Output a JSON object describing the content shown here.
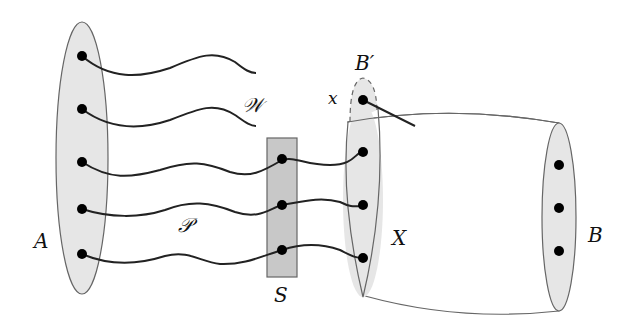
{
  "diagram": {
    "labels": {
      "A": "A",
      "W": "𝒲",
      "P": "𝒫",
      "S": "S",
      "X": "X",
      "B": "B",
      "B_prime": "B′",
      "x": "x"
    },
    "colors": {
      "ellipse_fill": "#e6e6e6",
      "separator_fill": "#c8c8c8",
      "stroke": "#555555",
      "path": "#222222",
      "vertex": "#000000"
    },
    "sets": [
      {
        "name": "A",
        "vertices": 5
      },
      {
        "name": "S",
        "vertices": 3
      },
      {
        "name": "X",
        "vertices": 3
      },
      {
        "name": "B'",
        "vertices": 1
      },
      {
        "name": "B",
        "vertices": 3
      }
    ],
    "path_families": [
      {
        "name": "W",
        "count": 2,
        "from": "A",
        "to": "open end"
      },
      {
        "name": "P",
        "count": 3,
        "from": "A",
        "to": "X",
        "via": "S"
      }
    ]
  }
}
